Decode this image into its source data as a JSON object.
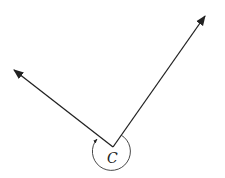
{
  "diagram": {
    "angle_label": "C",
    "vertex": [
      113,
      147
    ],
    "ray_left_tip": [
      14,
      70
    ],
    "ray_right_tip": [
      205,
      16
    ],
    "arc": {
      "center": [
        113,
        150
      ],
      "radius": 19
    },
    "stroke_color": "#222222",
    "background": "#ffffff"
  }
}
